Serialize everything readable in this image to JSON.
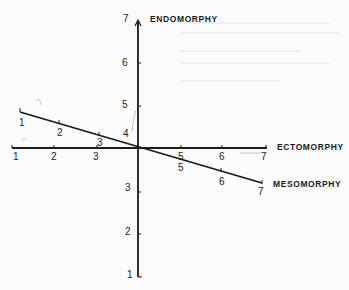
{
  "diagram": {
    "type": "somatotype-axes",
    "colors": {
      "background": "#fbfbfb",
      "ink": "#1a1a1a"
    },
    "axes": {
      "endomorphy": {
        "label": "ENDOMORPHY",
        "orientation": "vertical",
        "ticks": [
          "1",
          "2",
          "3",
          "4",
          "5",
          "6",
          "7"
        ]
      },
      "ectomorphy": {
        "label": "ECTOMORPHY",
        "orientation": "horizontal",
        "ticks": [
          "1",
          "2",
          "3",
          "4",
          "5",
          "6",
          "7"
        ]
      },
      "mesomorphy": {
        "label": "MESOMORPHY",
        "orientation": "diagonal",
        "ticks": [
          "1",
          "2",
          "3",
          "4",
          "5",
          "6",
          "7"
        ]
      }
    },
    "labels": {
      "endo_7": "7",
      "endo_6": "6",
      "endo_5": "5",
      "endo_4": "4",
      "endo_3": "3",
      "endo_2": "2",
      "endo_1": "1",
      "ecto_1": "1",
      "ecto_2": "2",
      "ecto_3": "3",
      "ecto_5": "5",
      "ecto_6": "6",
      "ecto_7": "7",
      "meso_1": "1",
      "meso_2": "2",
      "meso_3": "3",
      "meso_5": "5",
      "meso_6": "6",
      "meso_7": "7"
    }
  }
}
